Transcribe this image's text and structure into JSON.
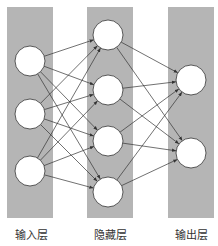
{
  "diagram": {
    "type": "neural-network",
    "colors": {
      "band": "#b5b5b5",
      "node_fill": "#ffffff",
      "node_stroke": "#333333",
      "edge": "#333333",
      "background": "#ffffff"
    },
    "layers": [
      {
        "id": "input",
        "label": "输入层",
        "band": {
          "x": 7,
          "y": 7,
          "w": 46,
          "h": 211
        },
        "nodes": [
          [
            30,
            61
          ],
          [
            30,
            114
          ],
          [
            30,
            171
          ]
        ]
      },
      {
        "id": "hidden",
        "label": "隐藏层",
        "band": {
          "x": 87,
          "y": 7,
          "w": 46,
          "h": 211
        },
        "nodes": [
          [
            108,
            35
          ],
          [
            108,
            90
          ],
          [
            108,
            141
          ],
          [
            108,
            192
          ]
        ]
      },
      {
        "id": "output",
        "label": "输出层",
        "band": {
          "x": 168,
          "y": 7,
          "w": 46,
          "h": 211
        },
        "nodes": [
          [
            191,
            80
          ],
          [
            191,
            153
          ]
        ]
      }
    ],
    "node_radius": 15,
    "connections": "fully-connected input→hidden, hidden→output, arrowheads at target"
  },
  "labels": {
    "input": "输入层",
    "hidden": "隐藏层",
    "output": "输出层"
  }
}
